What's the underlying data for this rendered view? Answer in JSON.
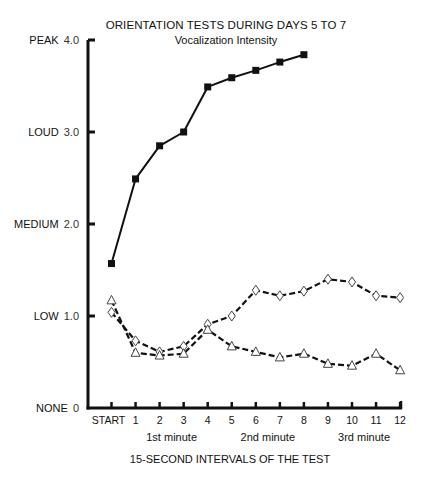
{
  "chart_data": {
    "type": "line",
    "title": "ORIENTATION TESTS DURING DAYS 5 TO 7",
    "subtitle": "Vocalization Intensity",
    "xlabel": "15-SECOND INTERVALS OF THE TEST",
    "ylabel": "",
    "categories": [
      "START",
      "1",
      "2",
      "3",
      "4",
      "5",
      "6",
      "7",
      "8",
      "9",
      "10",
      "11",
      "12"
    ],
    "minute_labels": [
      {
        "label": "1st minute",
        "center_index": 2.5
      },
      {
        "label": "2nd minute",
        "center_index": 6.5
      },
      {
        "label": "3rd minute",
        "center_index": 10.5
      }
    ],
    "y_ticks": [
      {
        "value": 0,
        "word": "NONE",
        "num": "0"
      },
      {
        "value": 1,
        "word": "LOW",
        "num": "1.0"
      },
      {
        "value": 2,
        "word": "MEDIUM",
        "num": "2.0"
      },
      {
        "value": 3,
        "word": "LOUD",
        "num": "3.0"
      },
      {
        "value": 4,
        "word": "PEAK",
        "num": "4.0"
      }
    ],
    "ylim": [
      0,
      4
    ],
    "grid": false,
    "legend": null,
    "series": [
      {
        "name": "filled-square",
        "marker": "square-filled",
        "line": "solid",
        "color": "#111111",
        "values": [
          1.57,
          2.49,
          2.85,
          3.0,
          3.49,
          3.59,
          3.67,
          3.76,
          3.84,
          null,
          null,
          null,
          null
        ]
      },
      {
        "name": "open-diamond",
        "marker": "diamond-open",
        "line": "dashed",
        "color": "#111111",
        "values": [
          1.04,
          0.73,
          0.61,
          0.67,
          0.91,
          1.0,
          1.28,
          1.22,
          1.27,
          1.4,
          1.37,
          1.22,
          1.2
        ]
      },
      {
        "name": "open-triangle",
        "marker": "triangle-open",
        "line": "dashed",
        "color": "#111111",
        "values": [
          1.17,
          0.6,
          0.57,
          0.59,
          0.85,
          0.67,
          0.61,
          0.55,
          0.59,
          0.48,
          0.46,
          0.59,
          0.41
        ]
      }
    ]
  }
}
